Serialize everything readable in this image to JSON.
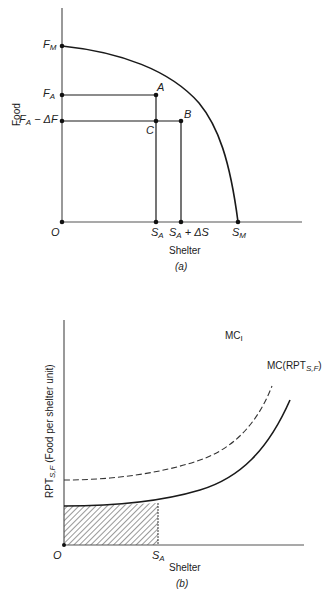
{
  "panel_a": {
    "caption": "(a)",
    "x_axis_title": "Shelter",
    "y_axis_title": "Food",
    "origin_label": "O",
    "y_ticks": [
      {
        "main": "F",
        "sub": "M",
        "suffix": ""
      },
      {
        "main": "F",
        "sub": "A",
        "suffix": ""
      },
      {
        "main": "F",
        "sub": "A",
        "suffix": " − ΔF"
      }
    ],
    "x_ticks": [
      {
        "main": "S",
        "sub": "A",
        "suffix": ""
      },
      {
        "main": "S",
        "sub": "A",
        "suffix": " + ΔS"
      },
      {
        "main": "S",
        "sub": "M",
        "suffix": ""
      }
    ],
    "points": [
      "A",
      "B",
      "C"
    ],
    "curve": "production possibilities frontier from F_M to S_M"
  },
  "panel_b": {
    "caption": "(b)",
    "x_axis_title": "Shelter",
    "y_axis_title_main": "RPT",
    "y_axis_title_sub": "S,F",
    "y_axis_title_rest": " (Food per shelter unit)",
    "origin_label": "O",
    "x_tick": {
      "main": "S",
      "sub": "A"
    },
    "curves": [
      {
        "name": "MC_I",
        "label_main": "MC",
        "label_sub": "I",
        "style": "dashed"
      },
      {
        "name": "MC(RPT_S,F)",
        "label_main": "MC(RPT",
        "label_sub": "S,F",
        "label_end": ")",
        "style": "solid"
      }
    ],
    "shaded_area": "hatched region under MC curve from O to S_A"
  },
  "colors": {
    "line": "#1a1a1a",
    "axis": "#555555",
    "hatch": "#333333",
    "accent_delta": "#c0392b"
  }
}
